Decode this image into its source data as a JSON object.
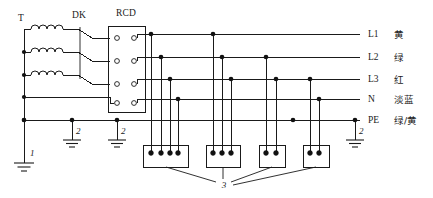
{
  "diagram": {
    "components": {
      "transformer_label": "T",
      "isolator_label": "DK",
      "rcd_label": "RCD"
    },
    "buses": [
      {
        "id": "L1",
        "name": "L1",
        "color_name": "黄"
      },
      {
        "id": "L2",
        "name": "L2",
        "color_name": "绿"
      },
      {
        "id": "L3",
        "name": "L3",
        "color_name": "红"
      },
      {
        "id": "N",
        "name": "N",
        "color_name": "淡蓝"
      },
      {
        "id": "PE",
        "name": "PE",
        "color_name": "绿/黄"
      }
    ],
    "earth_labels": {
      "main": "1",
      "repeated": "2",
      "outlets": "3"
    },
    "earth_marks": [
      {
        "ref": "2"
      },
      {
        "ref": "2"
      },
      {
        "ref": "2"
      }
    ],
    "outlets": [
      {
        "terminals": 4
      },
      {
        "terminals": 3
      },
      {
        "terminals": 2
      },
      {
        "terminals": 2
      }
    ],
    "colors": {
      "line": "#1a1a1a",
      "background": "#ffffff"
    }
  }
}
